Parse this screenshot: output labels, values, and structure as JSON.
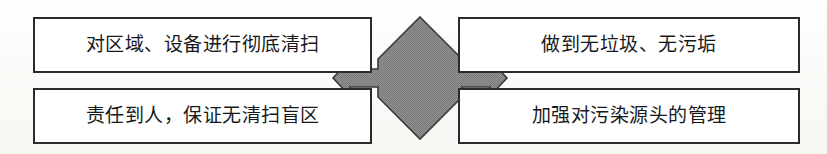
{
  "diagram": {
    "type": "four-way-arrow-quadrant",
    "background_color": "#fbfbf9",
    "box_border_color": "#2b2b2b",
    "box_fill_color": "#ffffff",
    "arrow_fill_color": "#8a8a8a",
    "arrow_stroke_color": "#3a3a3a",
    "center_arrow_name": "four-way-arrow",
    "boxes": [
      {
        "id": "top-left",
        "label": "对区域、设备进行彻底清扫"
      },
      {
        "id": "top-right",
        "label": "做到无垃圾、无污垢"
      },
      {
        "id": "bottom-left",
        "label": "责任到人，保证无清扫盲区"
      },
      {
        "id": "bottom-right",
        "label": "加强对污染源头的管理"
      }
    ]
  }
}
